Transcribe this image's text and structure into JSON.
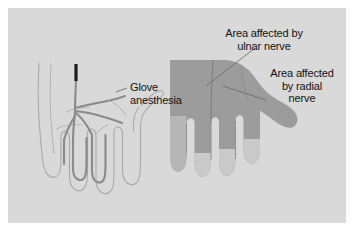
{
  "figure": {
    "background_color": "#ffffff",
    "panel_color": "#d9d9d9"
  },
  "labels": {
    "glove": {
      "line1": "Glove",
      "line2": "anesthesia"
    },
    "ulnar": {
      "line1": "Area affected by",
      "line2": "ulnar nerve"
    },
    "radial": {
      "line1": "Area affected",
      "line2": "by radial",
      "line3": "nerve"
    }
  },
  "colors": {
    "panel": "#d9d9d9",
    "hand_fill": "#9c9c9c",
    "hand_fill_light": "#b9b9b9",
    "fingertip": "#c9c9c9",
    "nerve": "#8a8a8a",
    "nerve_trunk": "#1a1a1a",
    "outline": "#b0b0b0",
    "leader": "#6e6e6e",
    "text": "#121212"
  },
  "left_hand": {
    "name": "glove-anesthesia-hand",
    "style": "line-drawing outline with nerve branches",
    "nerve_trunk_color": "#1a1a1a"
  },
  "right_hand": {
    "name": "nerve-territory-hand",
    "style": "filled silhouette with shaded nerve territories",
    "regions": [
      {
        "name": "ulnar-territory",
        "color": "#9c9c9c"
      },
      {
        "name": "radial-territory",
        "color": "#9c9c9c"
      },
      {
        "name": "unaffected-fingertips",
        "color": "#c9c9c9"
      }
    ]
  }
}
